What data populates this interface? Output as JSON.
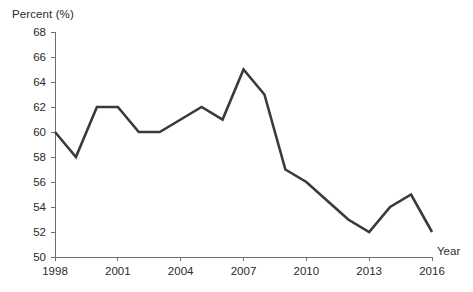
{
  "chart_data": {
    "type": "line",
    "title": "",
    "subtitle": "",
    "xlabel": "Year",
    "ylabel": "Percent (%)",
    "x": [
      1998,
      1999,
      2000,
      2001,
      2002,
      2003,
      2004,
      2005,
      2006,
      2007,
      2008,
      2009,
      2010,
      2011,
      2012,
      2013,
      2014,
      2015,
      2016
    ],
    "values": [
      60,
      58,
      62,
      62,
      60,
      60,
      61,
      62,
      61,
      65,
      63,
      57,
      56,
      54.5,
      53,
      52,
      54,
      55,
      52
    ],
    "series": [
      {
        "name": "Percent",
        "color": "#3a3a3a",
        "values": [
          60,
          58,
          62,
          62,
          60,
          60,
          61,
          62,
          61,
          65,
          63,
          57,
          56,
          54.5,
          53,
          52,
          54,
          55,
          52
        ]
      }
    ],
    "xlim": [
      1998,
      2016
    ],
    "ylim": [
      50,
      68
    ],
    "x_tick_labels": [
      "1998",
      "2001",
      "2004",
      "2007",
      "2010",
      "2013",
      "2016"
    ],
    "x_tick_values": [
      1998,
      2001,
      2004,
      2007,
      2010,
      2013,
      2016
    ],
    "y_tick_labels": [
      "50",
      "52",
      "54",
      "56",
      "58",
      "60",
      "62",
      "64",
      "66",
      "68"
    ],
    "y_tick_values": [
      50,
      52,
      54,
      56,
      58,
      60,
      62,
      64,
      66,
      68
    ],
    "grid": false,
    "legend": false,
    "legend_position": "none",
    "annotations": []
  },
  "axes": {
    "y_title": "Percent (%)",
    "x_title": "Year"
  },
  "style": {
    "line_color": "#3a3a3a",
    "axis_color": "#6e6e6e",
    "text_color": "#2b2b2b",
    "background": "#ffffff"
  }
}
